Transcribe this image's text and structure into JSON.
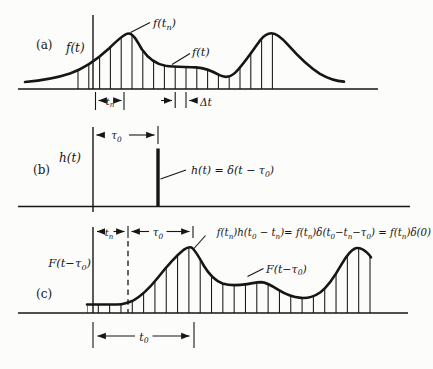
{
  "figure": {
    "ink": "#161616",
    "bg": "#fcfcfb",
    "panel_a": {
      "tag": "(a)",
      "axis_label": "f(t)",
      "peak_label": [
        [
          "f(t",
          0
        ],
        [
          "n",
          1
        ],
        [
          ")",
          0
        ]
      ],
      "curve_label": "f(t)",
      "tn_label": [
        [
          "t",
          0
        ],
        [
          "n",
          1
        ]
      ],
      "dt_label": [
        [
          "Δ",
          0
        ],
        [
          "t",
          0
        ]
      ]
    },
    "panel_b": {
      "tag": "(b)",
      "axis_label": "h(t)",
      "tau0_label": [
        [
          "τ",
          0
        ],
        [
          "0",
          1
        ]
      ],
      "impulse_label": [
        [
          "h(t) = δ(t − τ",
          0
        ],
        [
          "0",
          1
        ],
        [
          ")",
          0
        ]
      ]
    },
    "panel_c": {
      "tag": "(c)",
      "axis_label": [
        [
          "F(t−τ",
          0
        ],
        [
          "0",
          1
        ],
        [
          ")",
          0
        ]
      ],
      "tn_label": [
        [
          "t",
          0
        ],
        [
          "n",
          1
        ]
      ],
      "tau0_label": [
        [
          "τ",
          0
        ],
        [
          "0",
          1
        ]
      ],
      "formula": [
        [
          "f(t",
          0
        ],
        [
          "n",
          1
        ],
        [
          ")h(t",
          0
        ],
        [
          "0",
          1
        ],
        [
          " − t",
          0
        ],
        [
          "n",
          1
        ],
        [
          ")= f(t",
          0
        ],
        [
          "n",
          1
        ],
        [
          ")δ(t",
          0
        ],
        [
          "0",
          1
        ],
        [
          "−t",
          0
        ],
        [
          "n",
          1
        ],
        [
          "−τ",
          0
        ],
        [
          "0",
          1
        ],
        [
          ") = f(t",
          0
        ],
        [
          "n",
          1
        ],
        [
          ")δ(0)",
          0
        ]
      ],
      "curve_label": [
        [
          "F(t−τ",
          0
        ],
        [
          "0",
          1
        ],
        [
          ")",
          0
        ]
      ],
      "t0_label": [
        [
          "t",
          0
        ],
        [
          "0",
          1
        ]
      ]
    },
    "geometry": {
      "a_curve": "M25,82 C42,80.5 58,77.5 70,73.5 C83,69 97,59.5 109,48.5 C117,40.5 124,33.8 128.5,33.5 C133,33.4 136.5,40 142,49.5 C149,59.5 157,64.3 165.5,65.8 C175,67.2 186,66.8 196,67.4 C205,68 213,71.5 219.5,75.2 C225,77.9 230,77.4 235,72.9 C242,66.5 251.5,52.5 260,40.5 C264,35.2 268,33.3 271.5,33.3 C276.5,33.3 281.5,37.5 288.5,45.3 C297.5,55.5 309,66.8 320,73.8 C329,79 338,81.2 344,81.6",
      "a_region": "M25,82 C42,80.5 58,77.5 70,73.5 C83,69 97,59.5 109,48.5 C117,40.5 124,33.8 128.5,33.5 C133,33.4 136.5,40 142,49.5 C149,59.5 157,64.3 165.5,65.8 C175,67.2 186,66.8 196,67.4 C205,68 213,71.5 219.5,75.2 C225,77.9 230,77.4 235,72.9 C242,66.5 251.5,52.5 260,40.5 C264,35.2 268,33.3 271.5,33.3 C276.5,33.3 281.5,37.5 288.5,45.3 C297.5,55.5 309,66.8 320,73.8 C329,79 338,81.2 344,81.6 L344,89 L25,89 Z",
      "c_curve": "M87,304.5 L117,304.5 C123,304.2 128,303 133.5,300.3 C141,296.3 149,288.6 157,278.8 C166,267.4 176,256 184,249.6 C187,247.4 189.5,246.8 191.5,247.5 C194.5,249.3 198.5,256 204,266 C209.5,275 215.5,280.9 222.5,283.5 C229.5,285.7 238,285.5 247,284.1 C252,283.3 257.5,282.1 261,282.1 C266,282.4 271.5,285.4 278,289.6 C285,294 293.5,297.2 301,297.9 C308,298.4 314.5,296.4 320.5,292.2 C327.5,287 334.5,276.8 341.5,264.4 C346.5,255.6 351.5,249.7 355.5,248.2 C359.5,247.3 363.5,249.4 367,252.6 C369,254.4 370.3,256 371,257.4",
      "c_region": "M87,304.5 L117,304.5 C123,304.2 128,303 133.5,300.3 C141,296.3 149,288.6 157,278.8 C166,267.4 176,256 184,249.6 C187,247.4 189.5,246.8 191.5,247.5 C194.5,249.3 198.5,256 204,266 C209.5,275 215.5,280.9 222.5,283.5 C229.5,285.7 238,285.5 247,284.1 C252,283.3 257.5,282.1 261,282.1 C266,282.4 271.5,285.4 278,289.6 C285,294 293.5,297.2 301,297.9 C308,298.4 314.5,296.4 320.5,292.2 C327.5,287 334.5,276.8 341.5,264.4 C346.5,255.6 351.5,249.7 355.5,248.2 C359.5,247.3 363.5,249.4 367,252.6 C369,254.4 370.3,256 371,257.4 L371,313 L87,313 Z"
    },
    "hatch_a": {
      "x0": 78,
      "step": 10.8,
      "count": 19,
      "y0": 24,
      "y1": 89
    },
    "hatch_c": {
      "x0": 87,
      "step": 11.32,
      "count": 26,
      "y0": 240,
      "y1": 313
    }
  }
}
